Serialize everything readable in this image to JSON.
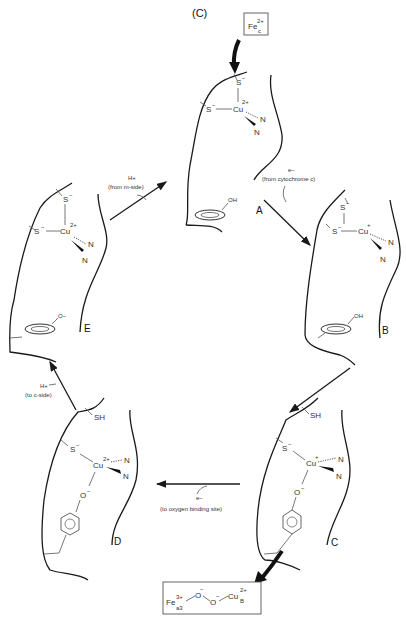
{
  "title": "(C)",
  "top_box": {
    "label": "Fe",
    "sup": "2+",
    "sub": "c"
  },
  "bottom_box": {
    "fe": "Fe",
    "fe_sup": "3+",
    "fe_sub": "a3",
    "o1": "O",
    "o1_sup": "−",
    "o2": "O",
    "o2_sup": "−",
    "cu": "Cu",
    "cu_sup": "2+",
    "cu_sub": "B"
  },
  "states": [
    {
      "id": "A",
      "copper": "Cu",
      "charge": "2+",
      "ligands": [
        "S−",
        "S−",
        "N",
        "N"
      ],
      "phenol": "OH"
    },
    {
      "id": "B",
      "copper": "Cu",
      "charge": "+",
      "ligands": [
        "S−",
        "S−",
        "N",
        "N"
      ],
      "phenol": "OH"
    },
    {
      "id": "C",
      "copper": "Cu",
      "charge": "+",
      "ligands": [
        "SH",
        "S−",
        "N",
        "N",
        "O−"
      ]
    },
    {
      "id": "D",
      "copper": "Cu",
      "charge": "2+",
      "ligands": [
        "SH",
        "S−",
        "N",
        "N",
        "O−"
      ]
    },
    {
      "id": "E",
      "copper": "Cu",
      "charge": "2+",
      "ligands": [
        "S−",
        "S−",
        "N",
        "N"
      ],
      "phenol": "O−"
    }
  ],
  "transitions": [
    {
      "from": "A",
      "to": "B",
      "species": "e−",
      "note": "(from cytochrome c)"
    },
    {
      "from": "C",
      "to": "D",
      "species": "e−",
      "note": "(to oxygen binding site)"
    },
    {
      "from": "D",
      "to": "E",
      "species": "H+",
      "note": "(to c-side)"
    },
    {
      "from": "E",
      "to": "A",
      "species": "H+",
      "note": "(from m-side)"
    }
  ],
  "atoms": {
    "S": "S",
    "Sm": "−",
    "N": "N",
    "O": "O",
    "SH": "SH",
    "OH": "OH",
    "Om": "O",
    "Cu": "Cu"
  }
}
